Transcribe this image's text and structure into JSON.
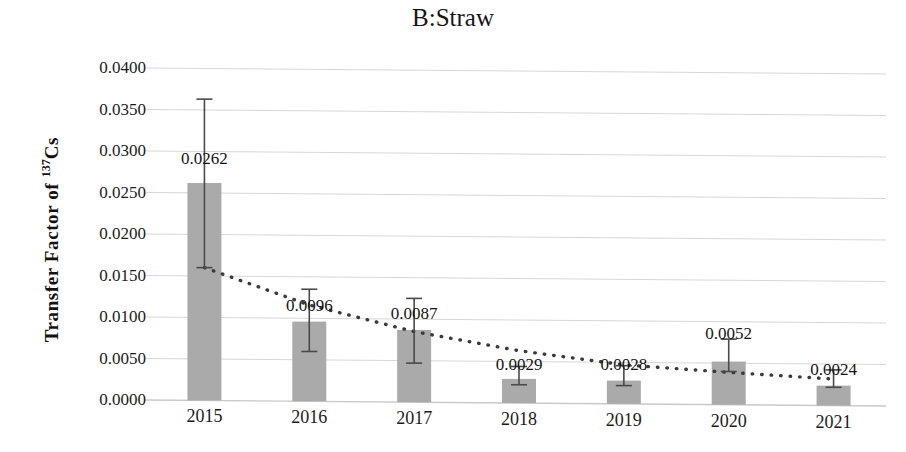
{
  "chart_data": {
    "type": "bar",
    "title": "B:Straw",
    "xlabel": "",
    "ylabel_plain": "Transfer Factor of 137Cs",
    "ylabel_prefix": "Transfer Factor of ",
    "ylabel_sup": "137",
    "ylabel_suffix": "Cs",
    "categories": [
      "2015",
      "2016",
      "2017",
      "2018",
      "2019",
      "2020",
      "2021"
    ],
    "values": [
      0.0262,
      0.0096,
      0.0087,
      0.0029,
      0.0028,
      0.0052,
      0.0024
    ],
    "value_labels": [
      "0.0262",
      "0.0096",
      "0.0087",
      "0.0029",
      "0.0028",
      "0.0052",
      "0.0024"
    ],
    "error_low": [
      0.016,
      0.006,
      0.0047,
      0.0022,
      0.0022,
      0.004,
      0.0022
    ],
    "error_high": [
      0.0363,
      0.0135,
      0.0125,
      0.0044,
      0.0046,
      0.0079,
      0.0043
    ],
    "trend_values": [
      0.016,
      0.0116,
      0.0085,
      0.0063,
      0.0047,
      0.0039,
      0.0032
    ],
    "ylim": [
      0.0,
      0.04
    ],
    "ytick_values": [
      0.04,
      0.035,
      0.03,
      0.025,
      0.02,
      0.015,
      0.01,
      0.005,
      0.0
    ],
    "ytick_labels": [
      "0.0400",
      "0.0350",
      "0.0300",
      "0.0250",
      "0.0200",
      "0.0150",
      "0.0100",
      "0.0050",
      "0.0000"
    ],
    "grid": true,
    "legend": "none",
    "bar_color": "#aaaaaa",
    "trendline_color": "#3a3a3a",
    "trendline_style": "dotted",
    "error_bar_color": "#4a4a4a",
    "gridline_color": "#d7d7d7",
    "axis_color": "#c9c9c9",
    "background_color": "#ffffff"
  }
}
